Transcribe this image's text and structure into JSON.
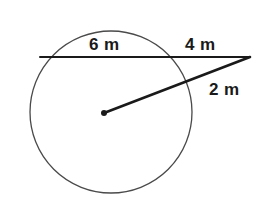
{
  "figure": {
    "background_color": "#ffffff",
    "width": 265,
    "height": 208
  },
  "labels": {
    "chord_inner": "6 m",
    "chord_outer": "4 m",
    "secant_outer": "2 m"
  },
  "colors": {
    "circle_stroke": "#4a4a4a",
    "line_stroke": "#1a1a1a",
    "center_dot": "#1a1a1a",
    "text": "#1a1a1a"
  },
  "geometry": {
    "circle": {
      "cx": 111,
      "cy": 112,
      "r": 81,
      "stroke_width": 1.3
    },
    "center_point": {
      "cx": 104,
      "cy": 113,
      "r": 3
    },
    "chord_line": {
      "x1": 40,
      "y1": 57,
      "x2": 250,
      "y2": 57,
      "stroke_width": 2
    },
    "secant_line": {
      "x1": 104,
      "y1": 113,
      "x2": 250,
      "y2": 57,
      "stroke_width": 2.6
    }
  },
  "chart_data": {
    "type": "diagram",
    "annotations": [
      {
        "name": "chord-inner-segment",
        "label": "6 m",
        "value": 6,
        "unit": "m",
        "description": "Chord portion inside the circle along the horizontal secant"
      },
      {
        "name": "chord-outer-segment",
        "label": "4 m",
        "value": 4,
        "unit": "m",
        "description": "External portion of the horizontal secant from circle to outside point"
      },
      {
        "name": "secant-outer-segment",
        "label": "2 m",
        "value": 2,
        "unit": "m",
        "description": "External portion of the second secant from circle to outside point"
      }
    ],
    "elements": [
      {
        "name": "circle",
        "type": "circle"
      },
      {
        "name": "center-point",
        "type": "point"
      },
      {
        "name": "horizontal-secant",
        "type": "line"
      },
      {
        "name": "radial-secant",
        "type": "line"
      }
    ]
  }
}
